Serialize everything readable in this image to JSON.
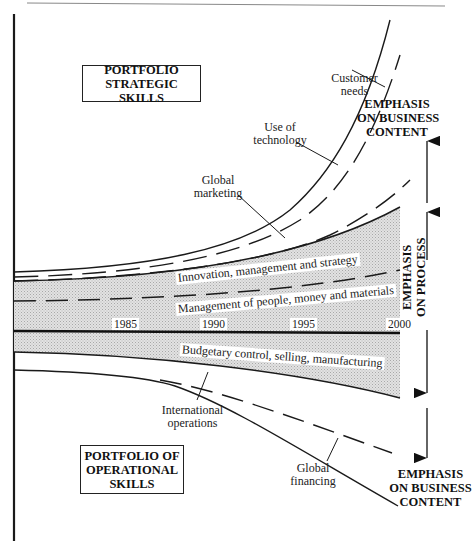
{
  "diagram": {
    "top_box": {
      "lines": [
        "PORTFOLIO",
        "STRATEGIC SKILLS"
      ]
    },
    "bottom_box": {
      "lines": [
        "PORTFOLIO OF",
        "OPERATIONAL",
        "SKILLS"
      ]
    },
    "upper_curves": [
      {
        "label": [
          "Customer",
          "needs"
        ],
        "style": "solid"
      },
      {
        "label": [
          "Use of",
          "technology"
        ],
        "style": "dashed"
      },
      {
        "label": [
          "Global",
          "marketing"
        ],
        "style": "dashed"
      }
    ],
    "band_labels": {
      "innovation": "Innovation, management and strategy",
      "management": "Management of people, money and materials",
      "budgetary": "Budgetary control, selling, manufacturing"
    },
    "timeline": {
      "years": [
        "1985",
        "1990",
        "1995",
        "2000"
      ]
    },
    "lower_curves": [
      {
        "label": [
          "International",
          "operations"
        ],
        "style": "solid"
      },
      {
        "label": [
          "Global",
          "financing"
        ],
        "style": "dashed"
      }
    ],
    "right_annotations": {
      "top": [
        "EMPHASIS",
        "ON BUSINESS",
        "CONTENT"
      ],
      "middle": [
        "EMPHASIS",
        "ON PROCESS"
      ],
      "bottom": [
        "EMPHASIS",
        "ON BUSINESS",
        "CONTENT"
      ]
    },
    "colors": {
      "band_fill": "#d9d9d9",
      "line": "#1a1a1a"
    }
  }
}
